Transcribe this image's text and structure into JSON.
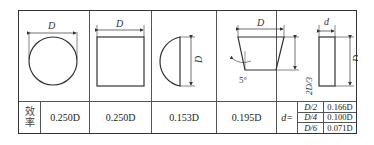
{
  "table": {
    "row_label": "效率",
    "shapes": [
      {
        "name": "circle",
        "dim_labels": [
          "D"
        ],
        "efficiency": "0.250D"
      },
      {
        "name": "square",
        "dim_labels": [
          "D"
        ],
        "efficiency": "0.250D"
      },
      {
        "name": "semicircle",
        "dim_labels": [
          "D"
        ],
        "efficiency": "0.153D"
      },
      {
        "name": "trapezoid",
        "dim_labels": [
          "D",
          "5°",
          "2D/3"
        ],
        "efficiency": "0.195D"
      },
      {
        "name": "rectangle",
        "dim_labels": [
          "d",
          "D"
        ],
        "efficiency_prefix": "d=",
        "rows": [
          {
            "d": "D/2",
            "value": "0.166D"
          },
          {
            "d": "D/4",
            "value": "0.100D"
          },
          {
            "d": "D/6",
            "value": "0.071D"
          }
        ]
      }
    ]
  }
}
